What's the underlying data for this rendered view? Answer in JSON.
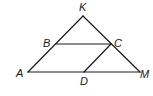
{
  "diagram": {
    "points": {
      "K": {
        "label": "K"
      },
      "A": {
        "label": "A"
      },
      "M": {
        "label": "M"
      },
      "B": {
        "label": "B"
      },
      "C": {
        "label": "C"
      },
      "D": {
        "label": "D"
      }
    },
    "segments": [
      [
        "K",
        "A"
      ],
      [
        "K",
        "M"
      ],
      [
        "A",
        "M"
      ],
      [
        "B",
        "C"
      ],
      [
        "C",
        "D"
      ]
    ]
  }
}
